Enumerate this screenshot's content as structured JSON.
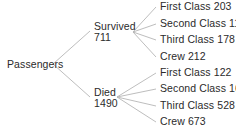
{
  "diagram": {
    "type": "tree",
    "line_color": "#b5b5b5",
    "text_color": "#2b2b2b",
    "root": {
      "label": "Passengers"
    },
    "branches": [
      {
        "label": "Survived",
        "value": "711",
        "children": [
          {
            "label": "First Class 203"
          },
          {
            "label": "Second Class 118"
          },
          {
            "label": "Third Class 178"
          },
          {
            "label": "Crew 212"
          }
        ]
      },
      {
        "label": "Died",
        "value": "1490",
        "children": [
          {
            "label": "First Class 122"
          },
          {
            "label": "Second Class 167"
          },
          {
            "label": "Third Class 528"
          },
          {
            "label": "Crew 673"
          }
        ]
      }
    ]
  }
}
